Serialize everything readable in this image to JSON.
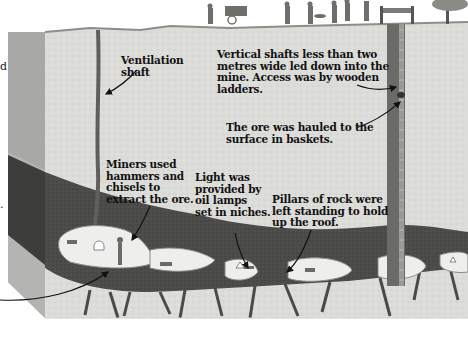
{
  "diagram": {
    "colors": {
      "background": "#ffffff",
      "ground": "#d9d9d6",
      "ground_face_left": "#a9a9a7",
      "ore_seam": "#4a4a48",
      "tunnel": "#eeeeec",
      "shaft": "#5a5a58",
      "text": "#111111"
    },
    "labels": [
      {
        "id": "ventilation",
        "text": "Ventilation\nshaft"
      },
      {
        "id": "vertical-shafts",
        "text": "Vertical shafts less than two\nmetres wide led down into the\nmine. Access was by wooden\nladders."
      },
      {
        "id": "ore-hauled",
        "text": "The ore was hauled to the\nsurface in baskets."
      },
      {
        "id": "miners",
        "text": "Miners used\nhammers and\nchisels to\nextract the ore."
      },
      {
        "id": "light",
        "text": "Light was\nprovided by\noil lamps\nset in niches."
      },
      {
        "id": "pillars",
        "text": "Pillars of rock were\nleft standing to hold\nup the roof."
      }
    ],
    "edge_fragments": [
      "d",
      "-",
      "."
    ]
  }
}
